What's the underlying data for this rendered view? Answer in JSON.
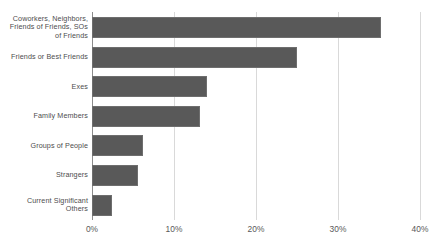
{
  "chart_data": {
    "type": "bar",
    "orientation": "horizontal",
    "title": "",
    "subtitle": "",
    "xlabel": "",
    "ylabel": "",
    "xlim": [
      0,
      40
    ],
    "xticks": [
      0,
      10,
      20,
      30,
      40
    ],
    "xtick_labels": [
      "0%",
      "10%",
      "20%",
      "30%",
      "40%"
    ],
    "grid": true,
    "legend": false,
    "legend_position": "none",
    "categories": [
      "Coworkers, Neighbors, Friends of Friends, SOs of Friends",
      "Friends or Best Friends",
      "Exes",
      "Family Members",
      "Groups of People",
      "Strangers",
      "Current Significant Others"
    ],
    "category_lines": [
      [
        "Coworkers, Neighbors,",
        "Friends of Friends, SOs",
        "of Friends"
      ],
      [
        "Friends or Best Friends"
      ],
      [
        "Exes"
      ],
      [
        "Family Members"
      ],
      [
        "Groups of People"
      ],
      [
        "Strangers"
      ],
      [
        "Current Significant",
        "Others"
      ]
    ],
    "values": [
      35.3,
      25.0,
      14.0,
      13.2,
      6.2,
      5.6,
      2.4
    ],
    "bar_color": "#595959",
    "bar_border_color": "#6e6e6e",
    "gridline_color": "#d9d9d9",
    "axis_color": "#8c8c8c",
    "label_color": "#4d4d4d",
    "tick_label_color": "#595959",
    "background_color": "#ffffff"
  }
}
